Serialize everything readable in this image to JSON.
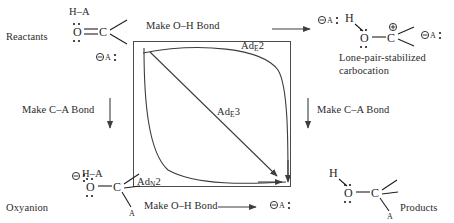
{
  "diagram": {
    "type": "more-oferrall-jencks",
    "title": "",
    "axes": {
      "top_label": "Make O–H Bond",
      "bottom_label": "Make O–H Bond",
      "left_label": "Make C–A Bond",
      "right_label": "Make C–A Bond"
    },
    "corners": {
      "top_left": {
        "name": "Reactants",
        "label": "Reactants",
        "reagent": "H–A",
        "counterion": "A",
        "structure": "O=C"
      },
      "top_right": {
        "name": "Lone-pair-stabilized carbocation",
        "label_line1": "Lone-pair-stabilized",
        "label_line2": "carbocation",
        "reagent": "A",
        "counterion": "A",
        "structure": "H-O-C+"
      },
      "bottom_left": {
        "name": "Oxyanion",
        "label": "Oxyanion",
        "reagent": "H–A",
        "structure": "(-)O-C-A"
      },
      "bottom_right": {
        "name": "Products",
        "label": "Products",
        "counterion": "A",
        "structure": "H-O-C-A"
      }
    },
    "pathways": [
      {
        "id": "adE2",
        "label": "Ad",
        "sub": "E",
        "num": "2",
        "description": "top edge curved path"
      },
      {
        "id": "adE3",
        "label": "Ad",
        "sub": "E",
        "num": "3",
        "description": "diagonal concerted path"
      },
      {
        "id": "adN2",
        "label": "Ad",
        "sub": "N",
        "num": "2",
        "description": "bottom edge curved path"
      }
    ],
    "atoms": {
      "O": "O",
      "C": "C",
      "H": "H",
      "A": "A",
      "minus": "⊖",
      "plus": "⊕",
      "colon": ":"
    },
    "colors": {
      "ink": "#2b2b2b",
      "stroke": "#4c4c4c",
      "atom": "#1f1f1f",
      "background": "#ffffff"
    }
  }
}
